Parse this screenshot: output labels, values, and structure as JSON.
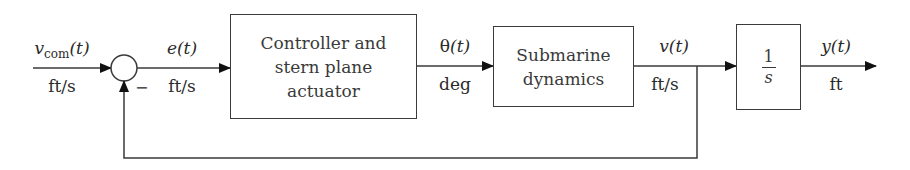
{
  "diagram": {
    "type": "feedback control block diagram",
    "input": {
      "symbol": "v",
      "subscript": "com",
      "arg": "(t)",
      "unit": "ft/s"
    },
    "summing_junction": {
      "feedback_sign": "−"
    },
    "error": {
      "symbol": "e",
      "arg": "(t)",
      "unit": "ft/s"
    },
    "blocks": [
      {
        "id": "controller",
        "lines": [
          "Controller and",
          "stern plane",
          "actuator"
        ]
      },
      {
        "id": "submarine",
        "lines": [
          "Submarine",
          "dynamics"
        ]
      },
      {
        "id": "integrator",
        "numerator": "1",
        "denominator": "s"
      }
    ],
    "theta": {
      "symbol": "θ",
      "arg": "(t)",
      "unit": "deg"
    },
    "velocity": {
      "symbol": "v",
      "arg": "(t)",
      "unit": "ft/s"
    },
    "output": {
      "symbol": "y",
      "arg": "(t)",
      "unit": "ft"
    },
    "colors": {
      "line": "#3a3a3a",
      "text": "#2a2a2a",
      "background": "#ffffff"
    }
  }
}
